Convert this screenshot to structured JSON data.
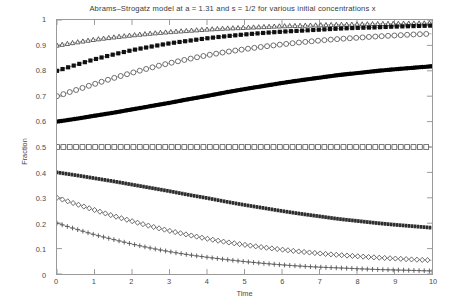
{
  "chart_data": {
    "type": "line",
    "title": "Abrams–Strogatz model at a = 1.31 and s = 1/2 for various initial concentrations x",
    "xlabel": "Time",
    "ylabel": "Fraction",
    "xlim": [
      0,
      10
    ],
    "ylim": [
      0,
      1
    ],
    "grid": false,
    "legend": "none",
    "xticks": [
      "0",
      "1",
      "2",
      "3",
      "4",
      "5",
      "6",
      "7",
      "8",
      "9",
      "10"
    ],
    "yticks": [
      "0",
      "0.1",
      "0.2",
      "0.3",
      "0.4",
      "0.5",
      "0.6",
      "0.7",
      "0.8",
      "0.9",
      "1"
    ],
    "x": [
      0,
      0.5,
      1,
      1.5,
      2,
      2.5,
      3,
      3.5,
      4,
      4.5,
      5,
      5.5,
      6,
      6.5,
      7,
      7.5,
      8,
      8.5,
      9,
      9.5,
      10
    ],
    "series": [
      {
        "name": "x = 0.9",
        "marker": "triangle-open",
        "color": "#3c3c3c",
        "values": [
          0.9,
          0.912,
          0.923,
          0.932,
          0.94,
          0.947,
          0.953,
          0.958,
          0.963,
          0.967,
          0.97,
          0.973,
          0.976,
          0.978,
          0.98,
          0.982,
          0.983,
          0.985,
          0.986,
          0.987,
          0.988
        ]
      },
      {
        "name": "x = 0.8",
        "marker": "square-filled",
        "color": "#101010",
        "values": [
          0.8,
          0.823,
          0.845,
          0.864,
          0.881,
          0.895,
          0.908,
          0.918,
          0.928,
          0.936,
          0.943,
          0.949,
          0.954,
          0.958,
          0.962,
          0.966,
          0.969,
          0.971,
          0.974,
          0.976,
          0.978
        ]
      },
      {
        "name": "x = 0.7",
        "marker": "circle-open",
        "color": "#4a4a4a",
        "values": [
          0.7,
          0.724,
          0.748,
          0.771,
          0.792,
          0.812,
          0.83,
          0.846,
          0.861,
          0.874,
          0.885,
          0.895,
          0.904,
          0.912,
          0.919,
          0.925,
          0.93,
          0.935,
          0.939,
          0.943,
          0.946
        ]
      },
      {
        "name": "x = 0.6",
        "marker": "dot-thick",
        "color": "#000000",
        "values": [
          0.6,
          0.611,
          0.623,
          0.635,
          0.648,
          0.661,
          0.674,
          0.688,
          0.701,
          0.715,
          0.728,
          0.74,
          0.752,
          0.763,
          0.773,
          0.783,
          0.791,
          0.799,
          0.806,
          0.812,
          0.818
        ]
      },
      {
        "name": "x = 0.5",
        "marker": "square-open",
        "color": "#555555",
        "values": [
          0.5,
          0.5,
          0.5,
          0.5,
          0.5,
          0.5,
          0.5,
          0.5,
          0.5,
          0.5,
          0.5,
          0.5,
          0.5,
          0.5,
          0.5,
          0.5,
          0.5,
          0.5,
          0.5,
          0.5,
          0.5
        ]
      },
      {
        "name": "x = 0.4",
        "marker": "dash-dense",
        "color": "#2e2e2e",
        "values": [
          0.4,
          0.389,
          0.377,
          0.365,
          0.352,
          0.339,
          0.326,
          0.312,
          0.299,
          0.285,
          0.272,
          0.26,
          0.248,
          0.237,
          0.227,
          0.217,
          0.209,
          0.201,
          0.194,
          0.188,
          0.182
        ]
      },
      {
        "name": "x = 0.3",
        "marker": "diamond-open",
        "color": "#4a4a4a",
        "values": [
          0.3,
          0.276,
          0.252,
          0.229,
          0.208,
          0.188,
          0.17,
          0.154,
          0.139,
          0.126,
          0.115,
          0.105,
          0.096,
          0.088,
          0.081,
          0.075,
          0.07,
          0.065,
          0.061,
          0.057,
          0.054
        ]
      },
      {
        "name": "x = 0.2",
        "marker": "plus",
        "color": "#555555",
        "values": [
          0.2,
          0.177,
          0.155,
          0.136,
          0.118,
          0.102,
          0.088,
          0.076,
          0.066,
          0.057,
          0.049,
          0.042,
          0.036,
          0.031,
          0.027,
          0.024,
          0.021,
          0.018,
          0.016,
          0.014,
          0.012
        ]
      }
    ]
  }
}
